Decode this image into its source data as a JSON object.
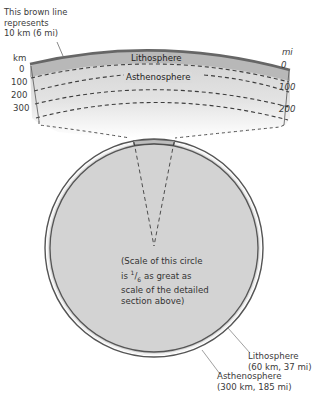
{
  "callout_brown_line": [
    "This brown line",
    "represents",
    "10 km (6 mi)"
  ],
  "left_scale": {
    "unit": "km",
    "ticks": [
      "0",
      "100",
      "200",
      "300"
    ]
  },
  "right_scale": {
    "unit": "mi",
    "ticks": [
      "0",
      "100",
      "200"
    ]
  },
  "section_labels": {
    "lithosphere": "Lithosphere",
    "asthenosphere": "Asthenosphere"
  },
  "circle_note": {
    "line1": "(Scale of this circle",
    "line2_prefix": "is ",
    "fraction_num": "1",
    "fraction_den": "6",
    "line2_suffix": " as great as",
    "line3": "scale of the detailed",
    "line4": "section above)"
  },
  "callout_lithosphere": [
    "Lithosphere",
    "(60 km, 37 mi)"
  ],
  "callout_asthenosphere": [
    "Asthenosphere",
    "(300 km, 185 mi)"
  ],
  "colors": {
    "brown_line": "#6e6e6e",
    "lithosphere_band": "#a9a9a9",
    "asthenosphere_fill": "#dcdcdc",
    "circle_fill": "#d4d4d4",
    "dash": "#3d3d3d"
  }
}
